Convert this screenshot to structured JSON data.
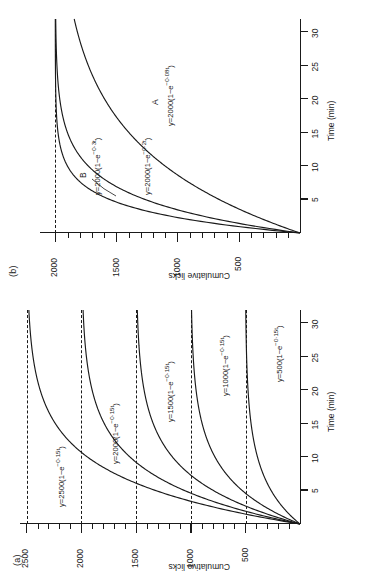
{
  "figure": {
    "orientation_note": "rotated-90-ccw",
    "panels": [
      {
        "tag": "(b)",
        "xlabel": "Time (min)",
        "ylabel": "Cumulative licks",
        "xticks": [
          "5",
          "10",
          "15",
          "20",
          "25",
          "30"
        ],
        "yticks": [
          "500",
          "1000",
          "1500",
          "2000"
        ],
        "curve_tags": [
          "A",
          "B"
        ],
        "equations": [
          "y=2000(1−e⁻⁰·³ᵗ)",
          "y=2000(1−e⁻⁰·²ᵗ)",
          "y=2000(1−e⁻⁰·⁰⁸ᵗ)"
        ]
      },
      {
        "tag": "(a)",
        "xlabel": "Time (min)",
        "ylabel": "Cumulative licks",
        "xticks": [
          "5",
          "10",
          "15",
          "20",
          "25",
          "30"
        ],
        "yticks": [
          "500",
          "1000",
          "1500",
          "2000",
          "2500"
        ],
        "equations": [
          "y=2500(1−e⁻⁰·¹⁵ᵗ)",
          "y=2000(1−e⁻⁰·¹⁵ᵗ)",
          "y=1500(1−e⁻⁰·¹⁵ᵗ)",
          "y=1000(1−e⁻⁰·¹⁵ᵗ)",
          "y=500(1−e⁻⁰·¹⁵ᵗ)"
        ]
      }
    ]
  },
  "panel_b": {
    "tag": "(b)",
    "xlabel": "Time (min)",
    "ylabel": "Cumulative licks",
    "ytick_500": "500",
    "ytick_1000": "1000",
    "ytick_1500": "1500",
    "ytick_2000": "2000",
    "xtick_5": "5",
    "xtick_10": "10",
    "xtick_15": "15",
    "xtick_20": "20",
    "xtick_25": "25",
    "xtick_30": "30",
    "tag_A": "A",
    "tag_B": "B",
    "eq_03": "y=2000(1−e",
    "eq_03_sup": "−0·3t",
    "eq_03_close": ")",
    "eq_02": "y=2000(1−e",
    "eq_02_sup": "−0·2t",
    "eq_02_close": ")",
    "eq_008": "y=2000(1−e",
    "eq_008_sup": "−0·08t",
    "eq_008_close": ")"
  },
  "panel_a": {
    "tag": "(a)",
    "xlabel": "Time (min)",
    "ylabel": "Cumulative licks",
    "ytick_500": "500",
    "ytick_1000": "1000",
    "ytick_1500": "1500",
    "ytick_2000": "2000",
    "ytick_2500": "2500",
    "xtick_5": "5",
    "xtick_10": "10",
    "xtick_15": "15",
    "xtick_20": "20",
    "xtick_25": "25",
    "xtick_30": "30",
    "eq_2500": "y=2500(1−e",
    "eq_2500_sup": "−0·15t",
    "eq_2500_close": ")",
    "eq_2000": "y=2000(1−e",
    "eq_2000_sup": "−0·15t",
    "eq_2000_close": ")",
    "eq_1500": "y=1500(1−e",
    "eq_1500_sup": "−0·15t",
    "eq_1500_close": ")",
    "eq_1000": "y=1000(1−e",
    "eq_1000_sup": "−0·15t",
    "eq_1000_close": ")",
    "eq_500": "y=500(1−e",
    "eq_500_sup": "−0·15t",
    "eq_500_close": ")"
  },
  "chart_data": [
    {
      "type": "line",
      "panel": "(b)",
      "title": "",
      "xlabel": "Time (min)",
      "ylabel": "Cumulative licks",
      "xlim": [
        0,
        32
      ],
      "ylim": [
        0,
        2150
      ],
      "xticks": [
        5,
        10,
        15,
        20,
        25,
        30
      ],
      "yticks": [
        500,
        1000,
        1500,
        2000
      ],
      "minor_ytick_step": 100,
      "grid": false,
      "legend": "inline-annotations",
      "asymptote_lines": [
        2000
      ],
      "series": [
        {
          "name": "y=2000(1−e^-0.3t)",
          "label": "B",
          "model": "A*(1-exp(-k*t))",
          "A": 2000,
          "k": 0.3,
          "x": [
            0,
            1,
            2,
            3,
            4,
            5,
            6,
            7,
            8,
            9,
            10,
            12,
            14,
            16,
            18,
            20,
            25,
            30
          ],
          "values": [
            0,
            518,
            902,
            1187,
            1397,
            1554,
            1669,
            1755,
            1819,
            1864,
            1900,
            1945,
            1970,
            1984,
            1991,
            1995,
            1999,
            2000
          ]
        },
        {
          "name": "y=2000(1−e^-0.2t)",
          "model": "A*(1-exp(-k*t))",
          "A": 2000,
          "k": 0.2,
          "x": [
            0,
            1,
            2,
            3,
            4,
            5,
            6,
            7,
            8,
            9,
            10,
            12,
            14,
            16,
            18,
            20,
            25,
            30
          ],
          "values": [
            0,
            363,
            659,
            903,
            1101,
            1264,
            1398,
            1507,
            1596,
            1669,
            1729,
            1819,
            1878,
            1918,
            1945,
            1963,
            1987,
            1995
          ]
        },
        {
          "name": "y=2000(1−e^-0.08t)",
          "label": "A",
          "model": "A*(1-exp(-k*t))",
          "A": 2000,
          "k": 0.08,
          "x": [
            0,
            2,
            4,
            6,
            8,
            10,
            12,
            14,
            16,
            18,
            20,
            22,
            24,
            26,
            28,
            30,
            32
          ],
          "values": [
            0,
            295,
            548,
            763,
            945,
            1101,
            1234,
            1348,
            1444,
            1527,
            1596,
            1656,
            1706,
            1749,
            1785,
            1818,
            1845
          ]
        }
      ]
    },
    {
      "type": "line",
      "panel": "(a)",
      "title": "",
      "xlabel": "Time (min)",
      "ylabel": "Cumulative licks",
      "xlim": [
        0,
        32
      ],
      "ylim": [
        0,
        2650
      ],
      "xticks": [
        5,
        10,
        15,
        20,
        25,
        30
      ],
      "yticks": [
        500,
        1000,
        1500,
        2000,
        2500
      ],
      "minor_ytick_step": 100,
      "grid": false,
      "legend": "inline-annotations",
      "asymptote_lines": [
        500,
        1000,
        1500,
        2000,
        2500
      ],
      "series": [
        {
          "name": "y=2500(1−e^-0.15t)",
          "model": "A*(1-exp(-k*t))",
          "A": 2500,
          "k": 0.15,
          "x": [
            0,
            2,
            4,
            6,
            8,
            10,
            12,
            14,
            16,
            18,
            20,
            24,
            28,
            32
          ],
          "values": [
            0,
            648,
            1128,
            1483,
            1747,
            1942,
            2086,
            2193,
            2272,
            2331,
            2376,
            2432,
            2463,
            2480
          ]
        },
        {
          "name": "y=2000(1−e^-0.15t)",
          "model": "A*(1-exp(-k*t))",
          "A": 2000,
          "k": 0.15,
          "x": [
            0,
            2,
            4,
            6,
            8,
            10,
            12,
            14,
            16,
            18,
            20,
            24,
            28,
            32
          ],
          "values": [
            0,
            519,
            902,
            1187,
            1397,
            1554,
            1669,
            1755,
            1818,
            1865,
            1900,
            1946,
            1970,
            1984
          ]
        },
        {
          "name": "y=1500(1−e^-0.15t)",
          "model": "A*(1-exp(-k*t))",
          "A": 1500,
          "k": 0.15,
          "x": [
            0,
            2,
            4,
            6,
            8,
            10,
            12,
            14,
            16,
            18,
            20,
            24,
            28,
            32
          ],
          "values": [
            0,
            389,
            677,
            890,
            1048,
            1165,
            1252,
            1316,
            1363,
            1399,
            1425,
            1459,
            1478,
            1488
          ]
        },
        {
          "name": "y=1000(1−e^-0.15t)",
          "model": "A*(1-exp(-k*t))",
          "A": 1000,
          "k": 0.15,
          "x": [
            0,
            2,
            4,
            6,
            8,
            10,
            12,
            14,
            16,
            18,
            20,
            24,
            28,
            32
          ],
          "values": [
            0,
            259,
            451,
            593,
            699,
            777,
            835,
            878,
            909,
            932,
            950,
            973,
            985,
            992
          ]
        },
        {
          "name": "y=500(1−e^-0.15t)",
          "model": "A*(1-exp(-k*t))",
          "A": 500,
          "k": 0.15,
          "x": [
            0,
            2,
            4,
            6,
            8,
            10,
            12,
            14,
            16,
            18,
            20,
            24,
            28,
            32
          ],
          "values": [
            0,
            130,
            226,
            297,
            349,
            389,
            417,
            439,
            454,
            466,
            475,
            486,
            493,
            496
          ]
        }
      ]
    }
  ]
}
